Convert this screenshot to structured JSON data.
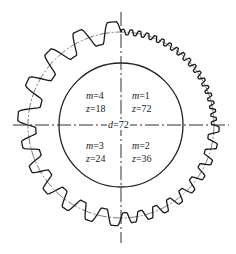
{
  "diagram": {
    "type": "gear-module-comparison",
    "pitch_diameter_label": "d=72",
    "pitch_diameter": 72,
    "quadrants": [
      {
        "position": "top-left",
        "m_label": "m=4",
        "z_label": "z=18",
        "m": 4,
        "z": 18
      },
      {
        "position": "top-right",
        "m_label": "m=1",
        "z_label": "z=72",
        "m": 1,
        "z": 72
      },
      {
        "position": "bottom-left",
        "m_label": "m=3",
        "z_label": "z=24",
        "m": 3,
        "z": 24
      },
      {
        "position": "bottom-right",
        "m_label": "m=2",
        "z_label": "z=36",
        "m": 2,
        "z": 36
      }
    ],
    "colors": {
      "line": "#222222",
      "background": "#ffffff"
    }
  }
}
